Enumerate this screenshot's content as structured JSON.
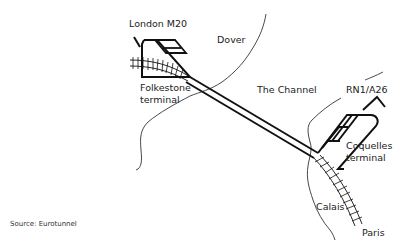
{
  "diagram": {
    "labels": {
      "london_m20": "London M20",
      "dover": "Dover",
      "folkestone_line1": "Folkestone",
      "folkestone_line2": "terminal",
      "the_channel": "The Channel",
      "rn1_a26": "RN1/A26",
      "coquelles_line1": "Coquelles",
      "coquelles_line2": "terminal",
      "calais": "Calais",
      "paris": "Paris"
    },
    "source": "Source: Eurotunnel",
    "colors": {
      "line": "#111111",
      "coast": "#333333",
      "background": "#ffffff"
    }
  }
}
